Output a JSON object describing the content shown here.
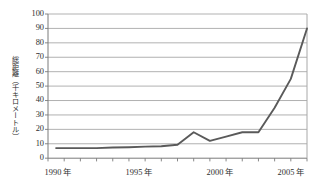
{
  "chart_data": {
    "type": "line",
    "title": "",
    "subtitle": "",
    "xlabel": "",
    "ylabel": "総距離（千キロメートル）",
    "ylabel_plain": "総距離(千キロメートル)",
    "xlim": [
      1990,
      2006
    ],
    "ylim": [
      0,
      100
    ],
    "y_ticks": [
      0,
      10,
      20,
      30,
      40,
      50,
      60,
      70,
      80,
      90,
      100
    ],
    "y_tick_labels": [
      "0",
      "10",
      "20",
      "30",
      "40",
      "50",
      "60",
      "70",
      "80",
      "90",
      "100"
    ],
    "x_ticks": [
      1990,
      1991,
      1992,
      1993,
      1994,
      1995,
      1996,
      1997,
      1998,
      1999,
      2000,
      2001,
      2002,
      2003,
      2004,
      2005,
      2006
    ],
    "x_tick_labels": [
      {
        "value": 1990,
        "label": "1990 年"
      },
      {
        "value": 1995,
        "label": "1995 年"
      },
      {
        "value": 2000,
        "label": "2000 年"
      },
      {
        "value": 2005,
        "label": "2005 年"
      }
    ],
    "grid": "horizontal",
    "legend": "none",
    "series": [
      {
        "name": "総距離",
        "color": "#5a5a5a",
        "x": [
          1990.5,
          1991,
          1992,
          1993,
          1994,
          1995,
          1996,
          1997,
          1998,
          1999,
          2000,
          2001,
          2002,
          2003,
          2004,
          2005,
          2006
        ],
        "values": [
          7,
          7,
          7,
          7,
          7.4,
          7.6,
          8,
          8.3,
          9.3,
          18,
          12,
          15,
          18,
          18,
          35,
          55,
          90
        ]
      }
    ]
  },
  "axis": {
    "y_title": "総距離（千キロメートル）"
  },
  "colors": {
    "line": "#5a5a5a",
    "grid": "#a8a8a8",
    "frame": "#7a7a7a",
    "text": "#2f2f2f"
  }
}
